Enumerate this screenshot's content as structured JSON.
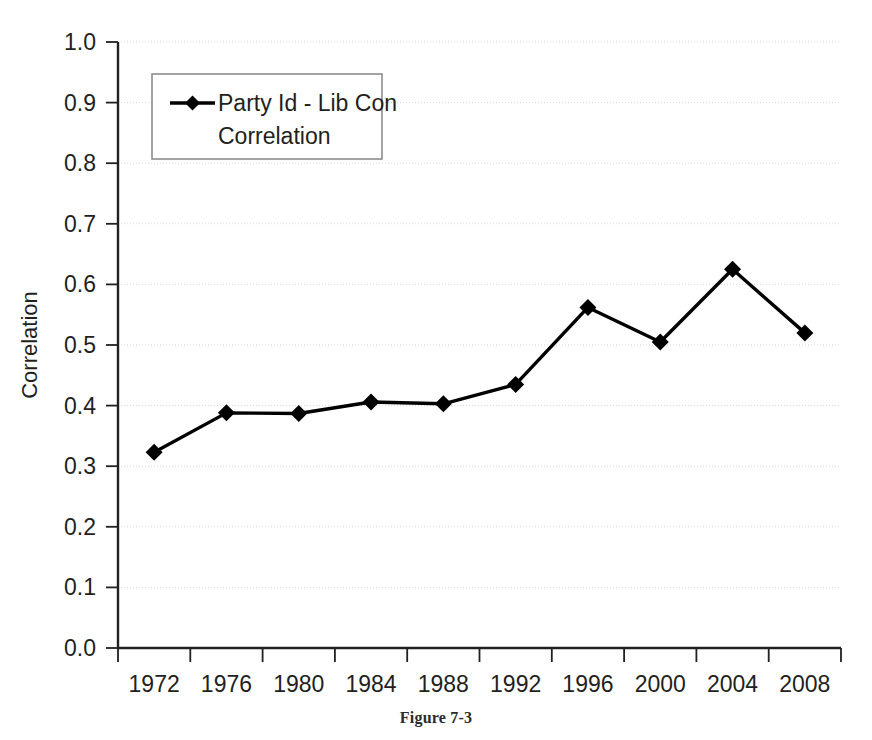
{
  "figure": {
    "caption": "Figure 7-3"
  },
  "chart_data": {
    "type": "line",
    "title": "",
    "xlabel": "",
    "ylabel": "Correlation",
    "categories": [
      "1972",
      "1976",
      "1980",
      "1984",
      "1988",
      "1992",
      "1996",
      "2000",
      "2004",
      "2008"
    ],
    "x": [
      1972,
      1976,
      1980,
      1984,
      1988,
      1992,
      1996,
      2000,
      2004,
      2008
    ],
    "series": [
      {
        "name": "Party Id - Lib Con Correlation",
        "values": [
          0.323,
          0.388,
          0.387,
          0.406,
          0.403,
          0.435,
          0.562,
          0.505,
          0.625,
          0.52
        ],
        "color": "#000000",
        "marker": "diamond"
      }
    ],
    "ylim": [
      0.0,
      1.0
    ],
    "ytick_values": [
      0.0,
      0.1,
      0.2,
      0.3,
      0.4,
      0.5,
      0.6,
      0.7,
      0.8,
      0.9,
      1.0
    ],
    "ytick_labels": [
      "0.0",
      "0.1",
      "0.2",
      "0.3",
      "0.4",
      "0.5",
      "0.6",
      "0.7",
      "0.8",
      "0.9",
      "1.0"
    ],
    "xtick_labels": [
      "1972",
      "1976",
      "1980",
      "1984",
      "1988",
      "1992",
      "1996",
      "2000",
      "2004",
      "2008"
    ],
    "grid": true,
    "grid_axis": "y",
    "grid_color": "#d9d9d9",
    "legend": {
      "position": "upper-left",
      "entries": [
        {
          "label_line_1": "Party Id - Lib Con",
          "label_line_2": "Correlation",
          "marker": "diamond",
          "color": "#000000"
        }
      ]
    }
  }
}
